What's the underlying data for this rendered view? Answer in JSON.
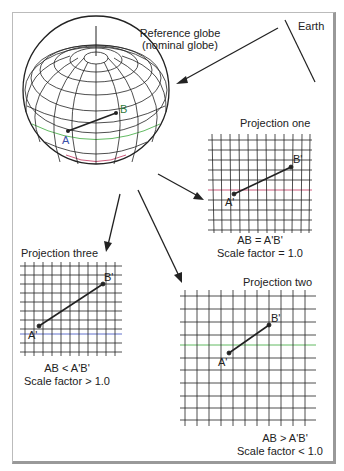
{
  "labels": {
    "earth": "Earth",
    "reference_globe_line1": "Reference globe",
    "reference_globe_line2": "(nominal globe)",
    "globe_point_a": "A",
    "globe_point_b": "B",
    "projection_one": {
      "title": "Projection one",
      "a": "A'",
      "b": "B'",
      "relation": "AB = A'B'",
      "scale": "Scale factor = 1.0"
    },
    "projection_two": {
      "title": "Projection two",
      "a": "A'",
      "b": "B'",
      "relation": "AB > A'B'",
      "scale": "Scale factor < 1.0"
    },
    "projection_three": {
      "title": "Projection three",
      "a": "A'",
      "b": "B'",
      "relation": "AB < A'B'",
      "scale": "Scale factor > 1.0"
    }
  },
  "colors": {
    "line": "#222222",
    "accent_red": "#c0305a",
    "accent_green": "#3aa83a",
    "accent_blue": "#3a4fc0",
    "point_a_label": "#3a4fa8",
    "point_b_label": "#2f7a3a"
  }
}
